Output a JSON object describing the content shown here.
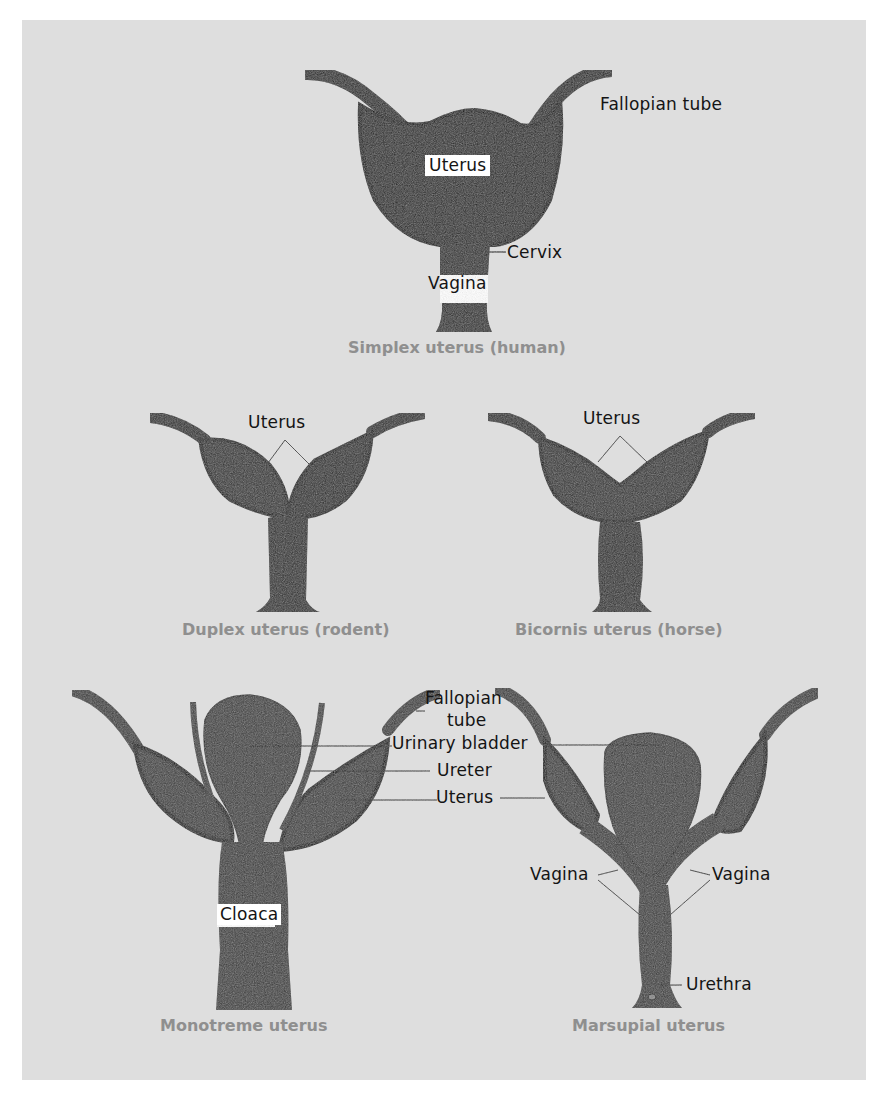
{
  "figure": {
    "background_color": "#dedede",
    "tissue_dark": "#1e1e1e",
    "tissue_mid": "#3a3a3a",
    "caption_color": "#8f8f8f",
    "label_color": "#141414"
  },
  "simplex": {
    "caption": "Simplex uterus (human)",
    "labels": {
      "fallopian_tube": "Fallopian tube",
      "uterus": "Uterus",
      "cervix": "Cervix",
      "vagina": "Vagina"
    }
  },
  "duplex": {
    "caption": "Duplex uterus (rodent)",
    "labels": {
      "uterus": "Uterus"
    }
  },
  "bicornis": {
    "caption": "Bicornis uterus (horse)",
    "labels": {
      "uterus": "Uterus"
    }
  },
  "shared_labels": {
    "fallopian_tube_line1": "Fallopian",
    "fallopian_tube_line2": "tube",
    "urinary_bladder": "Urinary bladder",
    "ureter": "Ureter",
    "uterus": "Uterus"
  },
  "monotreme": {
    "caption": "Monotreme uterus",
    "labels": {
      "cloaca": "Cloaca"
    }
  },
  "marsupial": {
    "caption": "Marsupial uterus",
    "labels": {
      "vagina_left": "Vagina",
      "vagina_right": "Vagina",
      "urethra": "Urethra"
    }
  }
}
